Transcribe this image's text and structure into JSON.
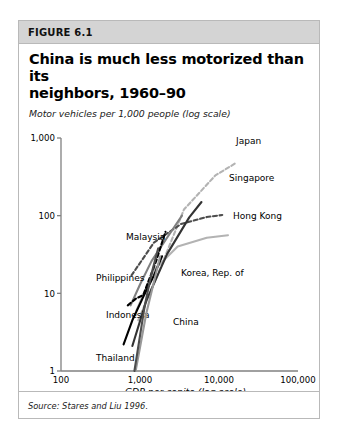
{
  "figure": {
    "label": "FIGURE 6.1",
    "title_line1": "China is much less motorized than its",
    "title_line2": "neighbors, 1960–90",
    "source": "Source: Stares and Liu 1996."
  },
  "chart_data": {
    "type": "line",
    "title": "China is much less motorized than its neighbors, 1960–90",
    "xlabel": "GDP per capita (log scale)",
    "ylabel": "Motor vehicles per 1,000 people (log scale)",
    "xscale": "log",
    "yscale": "log",
    "xlim": [
      100,
      100000
    ],
    "ylim": [
      1,
      1000
    ],
    "xticks": [
      100,
      1000,
      10000,
      100000
    ],
    "xtick_labels": [
      "100",
      "1,000",
      "10,000",
      "100,000"
    ],
    "yticks": [
      1,
      10,
      100,
      1000
    ],
    "ytick_labels": [
      "1",
      "10",
      "100",
      "1,000"
    ],
    "grid": false,
    "legend": "inline-annotations",
    "note": "Each series traces a country's path from 1960 to 1990 in GDP per capita vs motor vehicles per 1,000 people.",
    "series": [
      {
        "name": "Japan",
        "style": "dashed",
        "color": "#b3b3b3",
        "label_x": 235,
        "label_y": 141,
        "points": [
          [
            950,
            4.5
          ],
          [
            1700,
            18
          ],
          [
            3600,
            120
          ],
          [
            9000,
            330
          ],
          [
            16000,
            470
          ]
        ]
      },
      {
        "name": "Singapore",
        "style": "dashed",
        "color": "#4d4d4d",
        "label_x": 228,
        "label_y": 178,
        "points": [
          [
            780,
            17
          ],
          [
            1500,
            45
          ],
          [
            3300,
            78
          ],
          [
            7000,
            96
          ],
          [
            11000,
            102
          ]
        ]
      },
      {
        "name": "Hong Kong",
        "style": "solid",
        "color": "#b3b3b3",
        "label_x": 232,
        "label_y": 216,
        "points": [
          [
            900,
            6
          ],
          [
            1500,
            20
          ],
          [
            3000,
            40
          ],
          [
            7000,
            52
          ],
          [
            13000,
            56
          ]
        ]
      },
      {
        "name": "Malaysia",
        "style": "solid",
        "color": "#808080",
        "label_x": 125,
        "label_y": 237,
        "points": [
          [
            760,
            7
          ],
          [
            1000,
            13
          ],
          [
            1400,
            26
          ],
          [
            2200,
            52
          ],
          [
            3400,
            100
          ]
        ]
      },
      {
        "name": "Korea, Rep. of",
        "style": "solid",
        "color": "#333333",
        "label_x": 180,
        "label_y": 273,
        "points": [
          [
            800,
            2.1
          ],
          [
            1200,
            8
          ],
          [
            2200,
            32
          ],
          [
            4200,
            95
          ],
          [
            6000,
            150
          ]
        ]
      },
      {
        "name": "Philippines",
        "style": "dashed",
        "color": "#000000",
        "label_x": 95,
        "label_y": 278,
        "points": [
          [
            700,
            7
          ],
          [
            880,
            8.5
          ],
          [
            1100,
            9.5
          ],
          [
            1600,
            26
          ],
          [
            2100,
            62
          ]
        ]
      },
      {
        "name": "Indonesia",
        "style": "solid",
        "color": "#000000",
        "label_x": 105,
        "label_y": 315,
        "points": [
          [
            620,
            2.2
          ],
          [
            800,
            4.5
          ],
          [
            1100,
            9
          ],
          [
            1500,
            17
          ],
          [
            1900,
            30
          ]
        ]
      },
      {
        "name": "China",
        "style": "solid",
        "color": "#999999",
        "label_x": 172,
        "label_y": 322,
        "points": [
          [
            880,
            1.0
          ],
          [
            1000,
            2.0
          ],
          [
            1200,
            5.5
          ],
          [
            1500,
            14
          ],
          [
            1800,
            30
          ]
        ]
      },
      {
        "name": "Thailand",
        "style": "solid",
        "color": "#4d4d4d",
        "label_x": 95,
        "label_y": 358,
        "points": [
          [
            850,
            1.0
          ],
          [
            980,
            2.5
          ],
          [
            1150,
            7
          ],
          [
            1400,
            18
          ],
          [
            1700,
            38
          ]
        ]
      }
    ]
  }
}
